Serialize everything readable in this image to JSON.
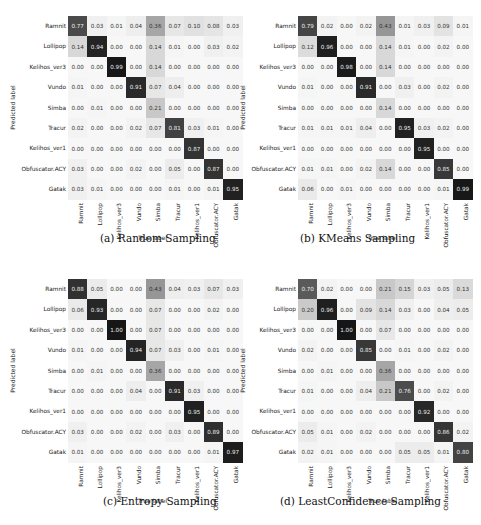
{
  "labels": [
    "Ramnit",
    "Lollipop",
    "Kelihos_ver3",
    "Vundo",
    "Simba",
    "Tracur",
    "Kelihos_ver1",
    "Obfuscator.ACY",
    "Gatak"
  ],
  "axis": {
    "xlabel": "True label",
    "ylabel": "Predicted label"
  },
  "captions": [
    "(a) Random Sampling",
    "(b) KMeans Sampling",
    "(c) Entropy Sampling",
    "(d) LeastConfidence Sampling"
  ],
  "chart_data": [
    {
      "type": "heatmap",
      "title": "(a) Random Sampling",
      "xlabel": "True label",
      "ylabel": "Predicted label",
      "x": [
        "Ramnit",
        "Lollipop",
        "Kelihos_ver3",
        "Vundo",
        "Simba",
        "Tracur",
        "Kelihos_ver1",
        "Obfuscator.ACY",
        "Gatak"
      ],
      "y": [
        "Ramnit",
        "Lollipop",
        "Kelihos_ver3",
        "Vundo",
        "Simba",
        "Tracur",
        "Kelihos_ver1",
        "Obfuscator.ACY",
        "Gatak"
      ],
      "values": [
        [
          0.77,
          0.03,
          0.01,
          0.04,
          0.36,
          0.07,
          0.1,
          0.08,
          0.03
        ],
        [
          0.14,
          0.94,
          0.0,
          0.0,
          0.14,
          0.01,
          0.0,
          0.03,
          0.02
        ],
        [
          0.0,
          0.0,
          0.99,
          0.0,
          0.14,
          0.0,
          0.0,
          0.0,
          0.0
        ],
        [
          0.01,
          0.0,
          0.0,
          0.91,
          0.07,
          0.04,
          0.0,
          0.0,
          0.0
        ],
        [
          0.0,
          0.01,
          0.0,
          0.0,
          0.21,
          0.0,
          0.0,
          0.0,
          0.0
        ],
        [
          0.02,
          0.0,
          0.0,
          0.02,
          0.07,
          0.81,
          0.03,
          0.01,
          0.0
        ],
        [
          0.0,
          0.0,
          0.0,
          0.0,
          0.0,
          0.0,
          0.87,
          0.0,
          0.0
        ],
        [
          0.03,
          0.0,
          0.0,
          0.02,
          0.0,
          0.05,
          0.0,
          0.87,
          0.0
        ],
        [
          0.03,
          0.01,
          0.0,
          0.0,
          0.0,
          0.01,
          0.0,
          0.01,
          0.95
        ]
      ]
    },
    {
      "type": "heatmap",
      "title": "(b) KMeans Sampling",
      "xlabel": "True label",
      "ylabel": "Predicted label",
      "x": [
        "Ramnit",
        "Lollipop",
        "Kelihos_ver3",
        "Vundo",
        "Simba",
        "Tracur",
        "Kelihos_ver1",
        "Obfuscator.ACY",
        "Gatak"
      ],
      "y": [
        "Ramnit",
        "Lollipop",
        "Kelihos_ver3",
        "Vundo",
        "Simba",
        "Tracur",
        "Kelihos_ver1",
        "Obfuscator.ACY",
        "Gatak"
      ],
      "values": [
        [
          0.79,
          0.02,
          0.0,
          0.02,
          0.43,
          0.01,
          0.03,
          0.09,
          0.01
        ],
        [
          0.12,
          0.96,
          0.0,
          0.0,
          0.14,
          0.01,
          0.0,
          0.02,
          0.0
        ],
        [
          0.0,
          0.0,
          0.98,
          0.0,
          0.14,
          0.0,
          0.0,
          0.0,
          0.0
        ],
        [
          0.01,
          0.0,
          0.0,
          0.91,
          0.0,
          0.03,
          0.0,
          0.02,
          0.0
        ],
        [
          0.0,
          0.0,
          0.0,
          0.0,
          0.14,
          0.0,
          0.0,
          0.0,
          0.0
        ],
        [
          0.01,
          0.01,
          0.01,
          0.04,
          0.0,
          0.95,
          0.03,
          0.02,
          0.0
        ],
        [
          0.0,
          0.0,
          0.0,
          0.0,
          0.0,
          0.0,
          0.95,
          0.0,
          0.0
        ],
        [
          0.01,
          0.01,
          0.0,
          0.02,
          0.14,
          0.0,
          0.0,
          0.85,
          0.0
        ],
        [
          0.06,
          0.0,
          0.01,
          0.0,
          0.0,
          0.0,
          0.0,
          0.01,
          0.99
        ]
      ]
    },
    {
      "type": "heatmap",
      "title": "(c) Entropy Sampling",
      "xlabel": "True label",
      "ylabel": "Predicted label",
      "x": [
        "Ramnit",
        "Lollipop",
        "Kelihos_ver3",
        "Vundo",
        "Simba",
        "Tracur",
        "Kelihos_ver1",
        "Obfuscator.ACY",
        "Gatak"
      ],
      "y": [
        "Ramnit",
        "Lollipop",
        "Kelihos_ver3",
        "Vundo",
        "Simba",
        "Tracur",
        "Kelihos_ver1",
        "Obfuscator.ACY",
        "Gatak"
      ],
      "values": [
        [
          0.88,
          0.05,
          0.0,
          0.0,
          0.43,
          0.04,
          0.03,
          0.07,
          0.03
        ],
        [
          0.06,
          0.93,
          0.0,
          0.0,
          0.07,
          0.0,
          0.0,
          0.02,
          0.0
        ],
        [
          0.0,
          0.0,
          1.0,
          0.0,
          0.07,
          0.0,
          0.0,
          0.0,
          0.0
        ],
        [
          0.01,
          0.0,
          0.0,
          0.94,
          0.07,
          0.03,
          0.0,
          0.01,
          0.0
        ],
        [
          0.0,
          0.01,
          0.0,
          0.0,
          0.36,
          0.0,
          0.0,
          0.0,
          0.0
        ],
        [
          0.0,
          0.0,
          0.0,
          0.04,
          0.0,
          0.91,
          0.03,
          0.0,
          0.0
        ],
        [
          0.0,
          0.0,
          0.0,
          0.0,
          0.0,
          0.0,
          0.95,
          0.0,
          0.0
        ],
        [
          0.03,
          0.0,
          0.0,
          0.02,
          0.0,
          0.03,
          0.0,
          0.89,
          0.0
        ],
        [
          0.01,
          0.0,
          0.0,
          0.0,
          0.0,
          0.0,
          0.0,
          0.01,
          0.97
        ]
      ]
    },
    {
      "type": "heatmap",
      "title": "(d) LeastConfidence Sampling",
      "xlabel": "True label",
      "ylabel": "Predicted label",
      "x": [
        "Ramnit",
        "Lollipop",
        "Kelihos_ver3",
        "Vundo",
        "Simba",
        "Tracur",
        "Kelihos_ver1",
        "Obfuscator.ACY",
        "Gatak"
      ],
      "y": [
        "Ramnit",
        "Lollipop",
        "Kelihos_ver3",
        "Vundo",
        "Simba",
        "Tracur",
        "Kelihos_ver1",
        "Obfuscator.ACY",
        "Gatak"
      ],
      "values": [
        [
          0.7,
          0.02,
          0.0,
          0.0,
          0.21,
          0.15,
          0.03,
          0.05,
          0.13
        ],
        [
          0.2,
          0.96,
          0.0,
          0.09,
          0.14,
          0.03,
          0.0,
          0.04,
          0.05
        ],
        [
          0.0,
          0.0,
          1.0,
          0.0,
          0.07,
          0.0,
          0.0,
          0.0,
          0.0
        ],
        [
          0.02,
          0.0,
          0.0,
          0.85,
          0.0,
          0.01,
          0.0,
          0.02,
          0.0
        ],
        [
          0.0,
          0.01,
          0.0,
          0.0,
          0.36,
          0.0,
          0.0,
          0.0,
          0.0
        ],
        [
          0.01,
          0.0,
          0.0,
          0.04,
          0.21,
          0.76,
          0.0,
          0.02,
          0.0
        ],
        [
          0.0,
          0.0,
          0.0,
          0.0,
          0.0,
          0.0,
          0.92,
          0.0,
          0.0
        ],
        [
          0.05,
          0.01,
          0.0,
          0.02,
          0.0,
          0.0,
          0.0,
          0.86,
          0.02
        ],
        [
          0.02,
          0.01,
          0.0,
          0.0,
          0.0,
          0.05,
          0.05,
          0.01,
          0.8
        ]
      ]
    }
  ]
}
